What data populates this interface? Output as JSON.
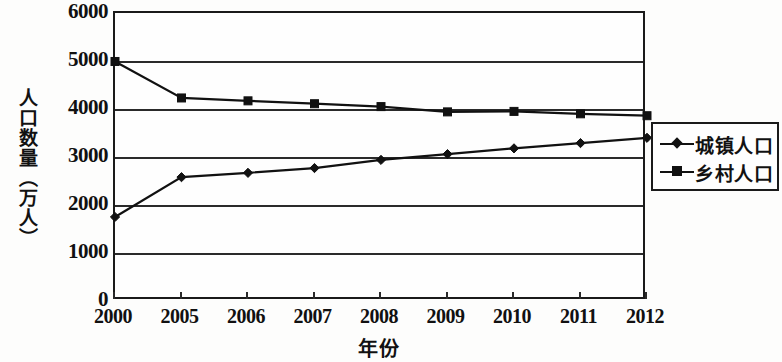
{
  "chart_data": {
    "type": "line",
    "title": "",
    "xlabel": "年份",
    "ylabel": "人口数量（万人）",
    "categories": [
      "2000",
      "2005",
      "2006",
      "2007",
      "2008",
      "2009",
      "2010",
      "2011",
      "2012"
    ],
    "series": [
      {
        "name": "城镇人口",
        "marker": "diamond",
        "color": "#111111",
        "values": [
          1750,
          2580,
          2670,
          2770,
          2940,
          3060,
          3180,
          3290,
          3400
        ]
      },
      {
        "name": "乡村人口",
        "marker": "square",
        "color": "#111111",
        "values": [
          4990,
          4230,
          4170,
          4110,
          4050,
          3940,
          3950,
          3900,
          3860
        ]
      }
    ],
    "ylim": [
      0,
      6000
    ],
    "yticks": [
      0,
      1000,
      2000,
      3000,
      4000,
      5000,
      6000
    ],
    "ytick_labels": [
      "0",
      "1000",
      "2000",
      "3000",
      "4000",
      "5000",
      "6000"
    ],
    "grid": true,
    "grid_axis": "y",
    "legend_position": "right"
  },
  "legend": {
    "entries": [
      {
        "label": "城镇人口",
        "marker": "diamond"
      },
      {
        "label": "乡村人口",
        "marker": "square"
      }
    ]
  }
}
